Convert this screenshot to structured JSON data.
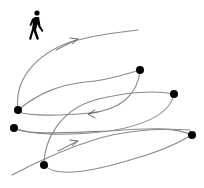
{
  "diagram": {
    "description": "Trajectory diagram of a pedestrian moving between waypoints",
    "colors": {
      "path": "#8a8a8a",
      "node": "#000000",
      "icon": "#000000",
      "background": "#ffffff"
    },
    "icon": {
      "name": "pedestrian-walking-icon",
      "glyph": "walking person"
    },
    "nodes": [
      {
        "id": "A",
        "x": 18,
        "y": 110
      },
      {
        "id": "B",
        "x": 14,
        "y": 128
      },
      {
        "id": "C",
        "x": 140,
        "y": 70
      },
      {
        "id": "D",
        "x": 174,
        "y": 94
      },
      {
        "id": "E",
        "x": 192,
        "y": 135
      },
      {
        "id": "F",
        "x": 44,
        "y": 165
      }
    ],
    "arrows": [
      {
        "id": "arrow-1",
        "x": 74,
        "y": 40,
        "direction": "right-up"
      },
      {
        "id": "arrow-2",
        "x": 90,
        "y": 113,
        "direction": "left"
      },
      {
        "id": "arrow-3",
        "x": 76,
        "y": 143,
        "direction": "right-up"
      }
    ]
  }
}
